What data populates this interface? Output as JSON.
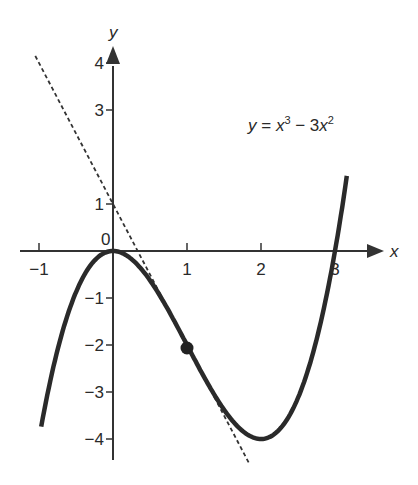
{
  "chart_data": {
    "type": "line",
    "title": "",
    "xlabel": "x",
    "ylabel": "y",
    "origin_label": "0",
    "xlim": [
      -1.1,
      3.6
    ],
    "ylim": [
      -4.5,
      4.2
    ],
    "x_ticks": [
      -1,
      1,
      2,
      3
    ],
    "x_tick_labels": [
      "−1",
      "1",
      "2",
      "3"
    ],
    "y_ticks": [
      4,
      3,
      1,
      -1,
      -2,
      -3,
      -4
    ],
    "y_tick_labels": [
      "4",
      "3",
      "1",
      "−1",
      "−2",
      "−3",
      "−4"
    ],
    "grid": false,
    "series": [
      {
        "name": "y = x³ − 3x²",
        "style": "solid",
        "x_range": [
          -0.97,
          3.16
        ],
        "x": [
          -0.97,
          -0.5,
          0,
          0.5,
          1,
          1.5,
          2,
          2.5,
          3,
          3.16
        ],
        "y": [
          -3.74,
          -0.875,
          0,
          -0.625,
          -2,
          -3.375,
          -4,
          -3.125,
          0,
          1.6
        ]
      },
      {
        "name": "tangent y = −3x + 1",
        "style": "dashed",
        "x_range": [
          -1.05,
          1.85
        ],
        "slope": -3,
        "intercept": 1
      }
    ],
    "points": [
      {
        "x": 1,
        "y": -2,
        "label": ""
      }
    ],
    "annotations": [
      {
        "text_parts": [
          "y",
          " = ",
          "x",
          "3",
          " − 3",
          "x",
          "2"
        ],
        "x": 1.83,
        "y": 2.55
      }
    ]
  }
}
